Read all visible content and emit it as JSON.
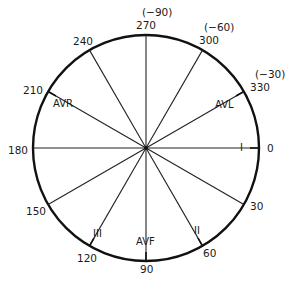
{
  "diagram": {
    "center": {
      "x": 146,
      "y": 148
    },
    "radius": 113,
    "colors": {
      "stroke": "#111111",
      "text": "#1a1a1a",
      "background": "#ffffff"
    },
    "degree_labels": [
      {
        "angle": 0,
        "text": "0"
      },
      {
        "angle": 30,
        "text": "30"
      },
      {
        "angle": 60,
        "text": "60"
      },
      {
        "angle": 90,
        "text": "90"
      },
      {
        "angle": 120,
        "text": "120"
      },
      {
        "angle": 150,
        "text": "150"
      },
      {
        "angle": 180,
        "text": "180"
      },
      {
        "angle": 210,
        "text": "210"
      },
      {
        "angle": 240,
        "text": "240"
      },
      {
        "angle": 270,
        "text": "270",
        "alt": "(−90)"
      },
      {
        "angle": 300,
        "text": "300",
        "alt": "(−60)"
      },
      {
        "angle": 330,
        "text": "330",
        "alt": "(−30)"
      }
    ],
    "lead_labels": [
      {
        "angle": 0,
        "text": "I"
      },
      {
        "angle": 60,
        "text": "II"
      },
      {
        "angle": 90,
        "text": "AVF"
      },
      {
        "angle": 120,
        "text": "III"
      },
      {
        "angle": 210,
        "text": "AVR"
      },
      {
        "angle": 330,
        "text": "AVL"
      }
    ]
  }
}
